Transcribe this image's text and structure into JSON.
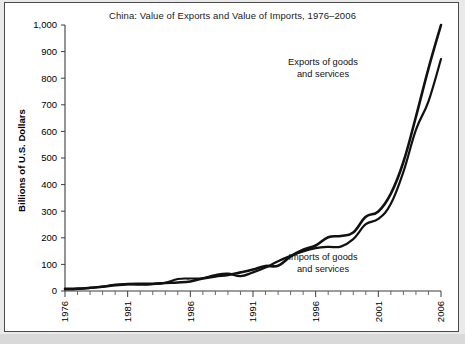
{
  "figure": {
    "background_color": "#ffffff",
    "frame_color": "#4a4a4a",
    "strip_color": "#d9d9d9"
  },
  "chart_data": {
    "type": "line",
    "title": "China: Value of Exports and Value of Imports, 1976–2006",
    "xlabel": "",
    "ylabel": "Billions of U.S. Dollars",
    "xlim": [
      1976,
      2006
    ],
    "ylim": [
      0,
      1000
    ],
    "grid": false,
    "legend_position": "inline-annotations",
    "y_ticks": [
      0,
      100,
      200,
      300,
      400,
      500,
      600,
      700,
      800,
      900,
      1000
    ],
    "y_tick_labels": [
      "0",
      "100",
      "200",
      "300",
      "400",
      "500",
      "600",
      "700",
      "800",
      "900",
      "1,000"
    ],
    "x_ticks_major": [
      1976,
      1981,
      1986,
      1991,
      1996,
      2001,
      2006
    ],
    "x_tick_labels": [
      "1976",
      "1981",
      "1986",
      "1991",
      "1996",
      "2001",
      "2006"
    ],
    "x_tick_label_rotation": -90,
    "x_ticks_minor_step": 1,
    "x": [
      1976,
      1977,
      1978,
      1979,
      1980,
      1981,
      1982,
      1983,
      1984,
      1985,
      1986,
      1987,
      1988,
      1989,
      1990,
      1991,
      1992,
      1993,
      1994,
      1995,
      1996,
      1997,
      1998,
      1999,
      2000,
      2001,
      2002,
      2003,
      2004,
      2005,
      2006
    ],
    "series": [
      {
        "name": "Exports of goods and services",
        "color": "#111111",
        "stroke_width": 2.6,
        "annotation": "Exports of goods and services",
        "values": [
          8,
          9,
          12,
          16,
          22,
          26,
          27,
          27,
          30,
          32,
          36,
          47,
          55,
          60,
          70,
          81,
          94,
          95,
          130,
          155,
          171,
          202,
          207,
          220,
          279,
          299,
          366,
          485,
          655,
          836,
          1000
        ]
      },
      {
        "name": "Imports of goods and services",
        "color": "#111111",
        "stroke_width": 2.2,
        "annotation": "Imports of goods and services",
        "values": [
          7,
          8,
          12,
          17,
          23,
          26,
          24,
          26,
          31,
          45,
          47,
          48,
          60,
          65,
          56,
          70,
          88,
          112,
          132,
          149,
          161,
          166,
          167,
          195,
          251,
          271,
          328,
          448,
          606,
          713,
          872
        ]
      }
    ],
    "annotations": [
      {
        "label": "Exports of goods and services",
        "line1": "Exports of goods",
        "line2": "and services",
        "x_px": 318,
        "y_px": 62
      },
      {
        "label": "Imports of goods and services",
        "line1": "Imports of goods",
        "line2": "and services",
        "x_px": 318,
        "y_px": 257
      }
    ]
  }
}
